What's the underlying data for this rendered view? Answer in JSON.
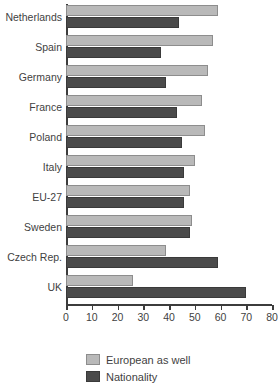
{
  "chart_data": {
    "type": "bar",
    "orientation": "horizontal",
    "title": "",
    "xlabel": "",
    "ylabel": "",
    "xlim": [
      0,
      80
    ],
    "xticks": [
      0,
      10,
      20,
      30,
      40,
      50,
      60,
      70,
      80
    ],
    "xtick_labels": [
      "0",
      "10",
      "20",
      "30",
      "40",
      "50",
      "60",
      "70",
      "80"
    ],
    "grid": false,
    "legend_position": "bottom",
    "categories": [
      "Netherlands",
      "Spain",
      "Germany",
      "France",
      "Poland",
      "Italy",
      "EU-27",
      "Sweden",
      "Czech Rep.",
      "UK"
    ],
    "series": [
      {
        "name": "European as well",
        "color": "#b9b9b9",
        "values": [
          59,
          57,
          55,
          53,
          54,
          50,
          48,
          49,
          39,
          26
        ]
      },
      {
        "name": "Nationality",
        "color": "#4b4b4b",
        "values": [
          44,
          37,
          39,
          43,
          45,
          46,
          46,
          48,
          59,
          70
        ]
      }
    ]
  },
  "legend": {
    "items": [
      {
        "label": "European as well",
        "swatch": "light"
      },
      {
        "label": "Nationality",
        "swatch": "dark"
      }
    ]
  },
  "colors": {
    "series_light": "#b9b9b9",
    "series_dark": "#4b4b4b",
    "axis": "#3c3c3c",
    "text": "#3f3f3f",
    "background": "#ffffff"
  }
}
